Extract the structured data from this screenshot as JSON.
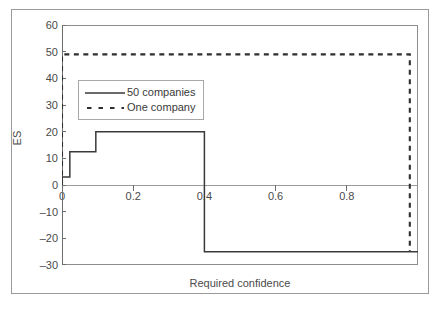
{
  "chart_data": {
    "type": "line",
    "title": "",
    "xlabel": "Required confidence",
    "ylabel": "ES",
    "xlim": [
      0,
      1.0
    ],
    "ylim": [
      -30,
      60
    ],
    "grid": false,
    "legend_position": "upper-left-inside",
    "x_ticks": [
      {
        "value": 0,
        "label": "0"
      },
      {
        "value": 0.2,
        "label": "0.2"
      },
      {
        "value": 0.4,
        "label": "0.4"
      },
      {
        "value": 0.6,
        "label": "0.6"
      },
      {
        "value": 0.8,
        "label": "0.8"
      }
    ],
    "y_ticks": [
      {
        "value": 60,
        "label": "60"
      },
      {
        "value": 50,
        "label": "50"
      },
      {
        "value": 40,
        "label": "40"
      },
      {
        "value": 30,
        "label": "30"
      },
      {
        "value": 20,
        "label": "20"
      },
      {
        "value": 10,
        "label": "10"
      },
      {
        "value": 0,
        "label": "0"
      },
      {
        "value": -10,
        "label": "–10"
      },
      {
        "value": -20,
        "label": "–20"
      },
      {
        "value": -30,
        "label": "–30"
      }
    ],
    "series": [
      {
        "name": "50 companies",
        "style": "solid",
        "color": "#3a3a3a",
        "points": [
          [
            0.0,
            0.0
          ],
          [
            0.0,
            3.0
          ],
          [
            0.022,
            3.0
          ],
          [
            0.022,
            12.5
          ],
          [
            0.095,
            12.5
          ],
          [
            0.095,
            20.0
          ],
          [
            0.4,
            20.0
          ],
          [
            0.4,
            -25.0
          ],
          [
            1.0,
            -25.0
          ]
        ]
      },
      {
        "name": "One company",
        "style": "dashed",
        "color": "#2e2e2e",
        "points": [
          [
            0.0,
            0.0
          ],
          [
            0.0,
            49.0
          ],
          [
            0.977,
            49.0
          ],
          [
            0.977,
            -25.0
          ]
        ]
      }
    ],
    "legend": [
      {
        "label": "50 companies",
        "style": "solid"
      },
      {
        "label": "One company",
        "style": "dashed"
      }
    ],
    "zero_line": 0
  }
}
